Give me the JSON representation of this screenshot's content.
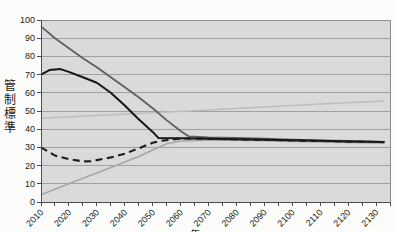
{
  "chart": {
    "background": "#fcfcfb",
    "plot_background": "#dadada",
    "grid_color": "#a0a0a0",
    "border_color": "#8c8c8c",
    "axis_color": "#4d4d4d",
    "label_color": "#222222"
  },
  "y_axis": {
    "title": "管制標準",
    "min": 0,
    "max": 100,
    "step": 10,
    "tick_labels": [
      "0",
      "10",
      "20",
      "30",
      "40",
      "50",
      "60",
      "70",
      "80",
      "90",
      "100"
    ]
  },
  "x_axis": {
    "title": "年",
    "min": 2010,
    "max": 2135,
    "minor_step": 5,
    "major_step": 10,
    "tick_labels": [
      "2010",
      "2020",
      "2030",
      "2040",
      "2050",
      "2060",
      "2070",
      "2080",
      "2090",
      "2100",
      "2110",
      "2120",
      "2130"
    ]
  },
  "chart_data": {
    "type": "line",
    "title": "",
    "xlabel": "年",
    "ylabel": "管制標準",
    "xlim": [
      2010,
      2135
    ],
    "ylim": [
      0,
      100
    ],
    "grid": "horizontal",
    "legend": "none",
    "series": [
      {
        "name": "light-flat-rising-line",
        "color": "#bdbdbd",
        "width": 1.5,
        "dash": null,
        "points": [
          [
            2010,
            46
          ],
          [
            2030,
            47.5
          ],
          [
            2050,
            49
          ],
          [
            2070,
            50.5
          ],
          [
            2090,
            52.2
          ],
          [
            2110,
            53.8
          ],
          [
            2133,
            55.5
          ]
        ]
      },
      {
        "name": "light-steep-rising-line",
        "color": "#a6a6a6",
        "width": 1.6,
        "dash": null,
        "points": [
          [
            2010,
            4
          ],
          [
            2015,
            7
          ],
          [
            2020,
            10
          ],
          [
            2025,
            13
          ],
          [
            2030,
            16
          ],
          [
            2035,
            19
          ],
          [
            2040,
            22
          ],
          [
            2045,
            25
          ],
          [
            2050,
            28.5
          ],
          [
            2055,
            32
          ],
          [
            2060,
            33.5
          ],
          [
            2070,
            34
          ],
          [
            2080,
            33.9
          ],
          [
            2090,
            33.6
          ],
          [
            2100,
            33.3
          ],
          [
            2110,
            33
          ],
          [
            2120,
            32.7
          ],
          [
            2133,
            32.3
          ]
        ]
      },
      {
        "name": "upper-solid-gray-line",
        "color": "#5f5f5f",
        "width": 1.8,
        "dash": null,
        "points": [
          [
            2010,
            96.5
          ],
          [
            2015,
            90
          ],
          [
            2020,
            84.5
          ],
          [
            2025,
            79
          ],
          [
            2030,
            74
          ],
          [
            2035,
            68.5
          ],
          [
            2040,
            63
          ],
          [
            2045,
            57.5
          ],
          [
            2050,
            51.5
          ],
          [
            2055,
            45
          ],
          [
            2060,
            39
          ],
          [
            2063,
            36
          ],
          [
            2070,
            35.5
          ],
          [
            2080,
            35.2
          ],
          [
            2090,
            34.8
          ],
          [
            2100,
            34.3
          ],
          [
            2110,
            33.9
          ],
          [
            2120,
            33.5
          ],
          [
            2133,
            33
          ]
        ]
      },
      {
        "name": "dark-solid-line",
        "color": "#151515",
        "width": 2,
        "dash": null,
        "points": [
          [
            2010,
            70
          ],
          [
            2013,
            72.5
          ],
          [
            2017,
            73
          ],
          [
            2020,
            71.5
          ],
          [
            2025,
            68.5
          ],
          [
            2030,
            65.5
          ],
          [
            2035,
            60
          ],
          [
            2040,
            53
          ],
          [
            2045,
            45.5
          ],
          [
            2050,
            38.5
          ],
          [
            2052,
            35.2
          ],
          [
            2060,
            35
          ],
          [
            2070,
            34.8
          ],
          [
            2080,
            34.5
          ],
          [
            2090,
            34.2
          ],
          [
            2100,
            33.9
          ],
          [
            2110,
            33.6
          ],
          [
            2120,
            33.3
          ],
          [
            2133,
            33
          ]
        ]
      },
      {
        "name": "dark-dashed-line",
        "color": "#1c1c1c",
        "width": 2.1,
        "dash": "7 4.5",
        "points": [
          [
            2010,
            30
          ],
          [
            2015,
            25.5
          ],
          [
            2020,
            23.5
          ],
          [
            2025,
            22.3
          ],
          [
            2028,
            22.4
          ],
          [
            2030,
            23
          ],
          [
            2035,
            24.5
          ],
          [
            2040,
            26.5
          ],
          [
            2045,
            29.5
          ],
          [
            2050,
            32.5
          ],
          [
            2053,
            33.6
          ],
          [
            2060,
            34.9
          ],
          [
            2070,
            34.7
          ],
          [
            2080,
            34.4
          ],
          [
            2090,
            34.1
          ],
          [
            2100,
            33.8
          ],
          [
            2110,
            33.5
          ],
          [
            2120,
            33.2
          ],
          [
            2133,
            32.9
          ]
        ]
      }
    ]
  }
}
